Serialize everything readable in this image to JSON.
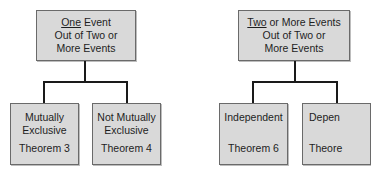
{
  "diagram": {
    "left_tree": {
      "root": {
        "underlined": "One",
        "line1_rest": " Event",
        "line2": "Out of Two or",
        "line3": "More Events"
      },
      "children": [
        {
          "title_line1": "Mutually",
          "title_line2": "Exclusive",
          "theorem": "Theorem 3"
        },
        {
          "title_line1": "Not Mutually",
          "title_line2": "Exclusive",
          "theorem": "Theorem 4"
        }
      ]
    },
    "right_tree": {
      "root": {
        "underlined": "Two",
        "line1_rest": " or More Events",
        "line2": "Out of Two or",
        "line3": "More Events"
      },
      "children": [
        {
          "title_line1": "Independent",
          "theorem": "Theorem 6"
        },
        {
          "title_line1": "Depen",
          "theorem": "Theore"
        }
      ]
    },
    "colors": {
      "box_fill": "#d9d9d9",
      "box_border": "#6a6a6a",
      "connector": "#1a1a1a",
      "background": "#ffffff"
    }
  }
}
